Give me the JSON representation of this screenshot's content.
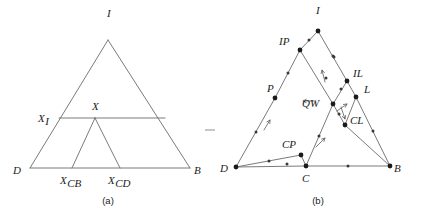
{
  "figure": {
    "panels": [
      {
        "caption": "(a)",
        "caption_x": 108,
        "caption_y": 204,
        "vertices": [
          {
            "name": "I",
            "label": "I",
            "x": 108,
            "y": 40,
            "lx": 107,
            "ly": 17,
            "dot": false
          },
          {
            "name": "D",
            "label": "D",
            "x": 30,
            "y": 168,
            "lx": 13,
            "ly": 174,
            "dot": false
          },
          {
            "name": "B",
            "label": "B",
            "x": 190,
            "y": 168,
            "lx": 194,
            "ly": 174,
            "dot": false
          }
        ],
        "interior_points": [
          {
            "name": "X",
            "label": "X",
            "sub": "",
            "x": 95,
            "y": 118,
            "lx": 92,
            "ly": 110,
            "dot": false
          },
          {
            "name": "XI",
            "label": "X",
            "sub": "I",
            "x": 59,
            "y": 118,
            "lx": 38,
            "ly": 122,
            "dot": false
          },
          {
            "name": "XCB",
            "label": "X",
            "sub": "CB",
            "x": 72,
            "y": 168,
            "lx": 60,
            "ly": 184,
            "dot": false
          },
          {
            "name": "XCD",
            "label": "X",
            "sub": "CD",
            "x": 120,
            "y": 168,
            "lx": 108,
            "ly": 184,
            "dot": false
          }
        ],
        "edges": [
          {
            "from": "D",
            "to": "I"
          },
          {
            "from": "I",
            "to": "B"
          },
          {
            "from": "D",
            "to": "B"
          },
          {
            "from": "XI",
            "to": "X"
          },
          {
            "from": "X",
            "to": "E1"
          },
          {
            "from": "X",
            "to": "XCB"
          },
          {
            "from": "X",
            "to": "XCD"
          }
        ],
        "extra_points": [
          {
            "name": "E1",
            "x": 165,
            "y": 118
          }
        ]
      },
      {
        "caption": "(b)",
        "caption_x": 318,
        "caption_y": 204,
        "vertices": [
          {
            "name": "I",
            "label": "I",
            "x": 318,
            "y": 31,
            "lx": 316,
            "ly": 14,
            "dot": true
          },
          {
            "name": "D",
            "label": "D",
            "x": 236,
            "y": 167,
            "lx": 220,
            "ly": 172,
            "dot": true
          },
          {
            "name": "B",
            "label": "B",
            "x": 390,
            "y": 166,
            "lx": 394,
            "ly": 172,
            "dot": true
          }
        ],
        "interior_points": [
          {
            "name": "IP",
            "label": "IP",
            "x": 300,
            "y": 50,
            "lx": 279,
            "ly": 45,
            "dot": true
          },
          {
            "name": "P",
            "label": "P",
            "x": 275,
            "y": 98,
            "lx": 267,
            "ly": 92,
            "dot": true
          },
          {
            "name": "IL",
            "label": "IL",
            "x": 347,
            "y": 81,
            "lx": 353,
            "ly": 77,
            "dot": true
          },
          {
            "name": "L",
            "label": "L",
            "x": 356,
            "y": 97,
            "lx": 364,
            "ly": 93,
            "dot": true
          },
          {
            "name": "QW",
            "label": "QW",
            "x": 333,
            "y": 104,
            "lx": 302,
            "ly": 107,
            "dot": true
          },
          {
            "name": "CL",
            "label": "CL",
            "x": 345,
            "y": 125,
            "lx": 350,
            "ly": 124,
            "dot": true
          },
          {
            "name": "CP",
            "label": "CP",
            "x": 301,
            "y": 155,
            "lx": 282,
            "ly": 148,
            "dot": true
          },
          {
            "name": "C",
            "label": "C",
            "x": 306,
            "y": 166,
            "lx": 302,
            "ly": 182,
            "dot": true
          }
        ],
        "edges": [
          {
            "from": "D",
            "to": "P"
          },
          {
            "from": "P",
            "to": "IP"
          },
          {
            "from": "IP",
            "to": "I"
          },
          {
            "from": "I",
            "to": "IL"
          },
          {
            "from": "IL",
            "to": "L"
          },
          {
            "from": "L",
            "to": "B"
          },
          {
            "from": "D",
            "to": "C"
          },
          {
            "from": "C",
            "to": "B"
          },
          {
            "from": "D",
            "to": "CP"
          },
          {
            "from": "CP",
            "to": "C"
          },
          {
            "from": "IP",
            "to": "QW"
          },
          {
            "from": "QW",
            "to": "IL"
          },
          {
            "from": "QW",
            "to": "CL"
          },
          {
            "from": "CL",
            "to": "L"
          },
          {
            "from": "QW",
            "to": "C"
          },
          {
            "from": "CL",
            "to": "B"
          }
        ],
        "direction_arrows": [
          {
            "name": "arrow-qw-left",
            "x1": 316,
            "y1": 101,
            "x2": 303,
            "y2": 101
          },
          {
            "name": "arrow-ip-i-up",
            "x1": 325,
            "y1": 82,
            "x2": 322,
            "y2": 70
          },
          {
            "name": "arrow-p-up",
            "x1": 264,
            "y1": 130,
            "x2": 270,
            "y2": 120
          },
          {
            "name": "arrow-cp-up",
            "x1": 316,
            "y1": 147,
            "x2": 325,
            "y2": 138
          },
          {
            "name": "arrow-cl-down",
            "x1": 341,
            "y1": 107,
            "x2": 345,
            "y2": 119
          },
          {
            "name": "arrow-l-up",
            "x1": 337,
            "y1": 111,
            "x2": 347,
            "y2": 104
          }
        ],
        "midpoint_dots": [
          {
            "x": 309,
            "y": 40
          },
          {
            "x": 288,
            "y": 73
          },
          {
            "x": 256,
            "y": 132
          },
          {
            "x": 333,
            "y": 56
          },
          {
            "x": 326,
            "y": 78
          },
          {
            "x": 334,
            "y": 57
          },
          {
            "x": 373,
            "y": 131
          },
          {
            "x": 269,
            "y": 161
          },
          {
            "x": 287,
            "y": 164
          },
          {
            "x": 348,
            "y": 166
          },
          {
            "x": 319,
            "y": 136
          },
          {
            "x": 341,
            "y": 89
          },
          {
            "x": 339,
            "y": 114
          }
        ]
      }
    ],
    "separator": {
      "name": "separator-dash",
      "x1": 205,
      "y1": 130,
      "x2": 215,
      "y2": 130
    }
  },
  "colors": {
    "line": "#6b6b6b",
    "line_dark": "#4a4a4a",
    "dot": "#1a1a1a",
    "text": "#1c1c1c",
    "background": "#ffffff"
  }
}
